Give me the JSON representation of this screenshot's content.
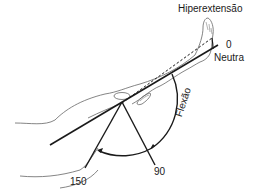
{
  "diagram": {
    "labels": {
      "hyperextension": "Hiperextensão",
      "zero": "0",
      "neutral": "Neutra",
      "flexion": "Flexão",
      "angle_150": "150",
      "angle_90": "90"
    },
    "angles": {
      "neutral": 0,
      "flexion_mid": 90,
      "flexion_max": 150
    },
    "colors": {
      "line": "#1a1a1a",
      "outline": "#555555",
      "background": "#ffffff"
    }
  }
}
